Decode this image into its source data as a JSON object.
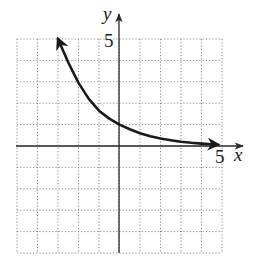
{
  "chart_data": {
    "type": "line",
    "title": "",
    "xlabel": "x",
    "ylabel": "y",
    "xlim": [
      -5,
      5
    ],
    "ylim": [
      -5,
      5
    ],
    "grid": true,
    "grid_style": "dotted",
    "tick_labels": {
      "x": [
        "5"
      ],
      "y": [
        "5"
      ]
    },
    "series": [
      {
        "name": "exponential decay curve",
        "description": "decreasing exponential through (0, 1), arrows at both ends, approaching x-axis as x increases",
        "x": [
          -3.0,
          -2.5,
          -2.0,
          -1.5,
          -1.0,
          -0.5,
          0.0,
          0.5,
          1.0,
          1.5,
          2.0,
          2.5,
          3.0,
          3.5,
          4.0,
          4.5,
          4.8
        ],
        "y": [
          5.0,
          3.9,
          2.95,
          2.2,
          1.65,
          1.28,
          1.0,
          0.78,
          0.6,
          0.46,
          0.35,
          0.27,
          0.2,
          0.15,
          0.11,
          0.08,
          0.06
        ],
        "arrows": [
          "start",
          "end"
        ],
        "color": "#1a1a1a"
      }
    ]
  },
  "labels": {
    "x_axis": "x",
    "y_axis": "y",
    "x_tick": "5",
    "y_tick": "5"
  },
  "colors": {
    "grid": "#8a8a8a",
    "axis": "#2a2a2a",
    "curve": "#1a1a1a",
    "background": "#ffffff"
  }
}
